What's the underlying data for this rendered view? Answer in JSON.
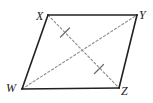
{
  "figure": {
    "kind": "geometry-diagram",
    "shape_name": "parallelogram",
    "canvas": {
      "width": 153,
      "height": 103,
      "background": "#ffffff"
    },
    "style": {
      "edge_color": "#231f20",
      "edge_width": 1.6,
      "diagonal_color": "#8c8c8c",
      "diagonal_width": 1.1,
      "diagonal_dash": "2.2,2.2",
      "tick_color": "#6e6e6e",
      "tick_width": 1.3,
      "label_color": "#1a1a1a"
    },
    "vertices": [
      {
        "id": "W",
        "label": "W",
        "x": 22,
        "y": 89
      },
      {
        "id": "X",
        "label": "X",
        "x": 48,
        "y": 15
      },
      {
        "id": "Y",
        "label": "Y",
        "x": 137,
        "y": 15
      },
      {
        "id": "Z",
        "label": "Z",
        "x": 119,
        "y": 88
      }
    ],
    "edges": [
      {
        "id": "WX",
        "from": "W",
        "to": "X",
        "style": "solid",
        "points": "22,89 48,15"
      },
      {
        "id": "XY",
        "from": "X",
        "to": "Y",
        "style": "solid",
        "points": "48,15 137,15"
      },
      {
        "id": "YZ",
        "from": "Y",
        "to": "Z",
        "style": "solid",
        "points": "137,15 119,88"
      },
      {
        "id": "ZW",
        "from": "Z",
        "to": "W",
        "style": "solid",
        "points": "119,88 22,89"
      }
    ],
    "diagonals": [
      {
        "id": "XZ",
        "from": "X",
        "to": "Z",
        "style": "dashed",
        "points": "48,15 119,88"
      },
      {
        "id": "WY",
        "from": "W",
        "to": "Y",
        "style": "dashed",
        "points": "22,89 137,15"
      }
    ],
    "tick_marks": [
      {
        "id": "tick-xz-upper",
        "on": "XZ",
        "cx": 65.0,
        "cy": 32.5,
        "x1": 60.5,
        "y1": 37.0,
        "x2": 69.5,
        "y2": 28.0
      },
      {
        "id": "tick-xz-lower",
        "on": "XZ",
        "cx": 99.0,
        "cy": 69.0,
        "x1": 94.5,
        "y1": 73.5,
        "x2": 103.5,
        "y2": 64.5
      }
    ],
    "labels": {
      "W": "W",
      "X": "X",
      "Y": "Y",
      "Z": "Z"
    }
  }
}
